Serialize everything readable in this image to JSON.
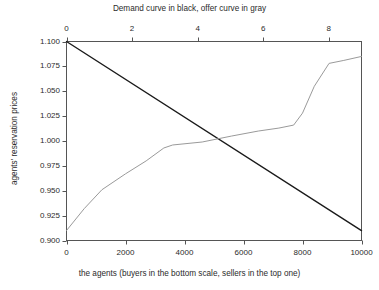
{
  "chart_data": {
    "type": "line",
    "title": "Demand curve in black, offer curve in gray",
    "xlabel": "the agents (buyers in the bottom scale, sellers in the top one)",
    "ylabel": "agents' reservation prices",
    "grid": false,
    "legend": "none (curves described in title)",
    "ylim": [
      0.9,
      1.1
    ],
    "yticks": [
      "0.900",
      "0.925",
      "0.950",
      "0.975",
      "1.000",
      "1.025",
      "1.050",
      "1.075",
      "1.100"
    ],
    "ytick_values": [
      0.9,
      0.925,
      0.95,
      0.975,
      1.0,
      1.025,
      1.05,
      1.075,
      1.1
    ],
    "bottom_axis": {
      "name": "buyers",
      "lim": [
        0,
        10000
      ],
      "ticks": [
        "0",
        "2000",
        "4000",
        "6000",
        "8000",
        "10000"
      ],
      "tick_values": [
        0,
        2000,
        4000,
        6000,
        8000,
        10000
      ]
    },
    "top_axis": {
      "name": "sellers",
      "lim": [
        0,
        9
      ],
      "ticks": [
        "0",
        "2",
        "4",
        "6",
        "8"
      ],
      "tick_values": [
        0,
        2,
        4,
        6,
        8
      ]
    },
    "series": [
      {
        "name": "Demand curve",
        "color": "#1a1a1a",
        "style": "solid",
        "axis": "bottom",
        "x": [
          0,
          10000
        ],
        "y": [
          1.1,
          0.91
        ]
      },
      {
        "name": "Offer curve",
        "color": "#9a9a9a",
        "style": "solid",
        "axis": "bottom",
        "x": [
          0,
          600,
          1200,
          2000,
          2700,
          3300,
          3600,
          4600,
          5600,
          6500,
          7200,
          7700,
          8000,
          8400,
          8900,
          9400,
          10000
        ],
        "y": [
          0.91,
          0.932,
          0.951,
          0.967,
          0.98,
          0.993,
          0.996,
          0.999,
          1.005,
          1.01,
          1.013,
          1.016,
          1.028,
          1.055,
          1.078,
          1.081,
          1.085
        ]
      }
    ]
  }
}
